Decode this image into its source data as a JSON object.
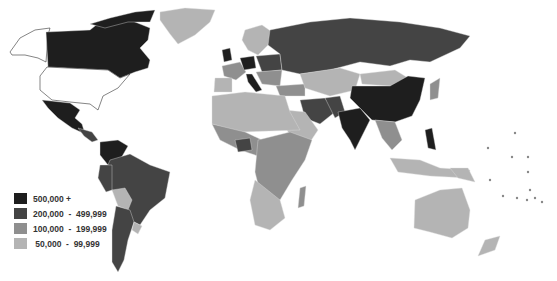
{
  "map": {
    "type": "choropleth-world",
    "colors": {
      "tier1": "#1e1e1e",
      "tier2": "#444444",
      "tier3": "#8f8f8f",
      "tier4": "#b4b4b4",
      "nodata": "#ffffff",
      "border": "#3a3a3a"
    }
  },
  "legend": {
    "items": [
      {
        "label": "500,000 +",
        "color": "#1e1e1e"
      },
      {
        "label": "200,000  -  499,999",
        "color": "#444444"
      },
      {
        "label": "100,000  -  199,999",
        "color": "#8f8f8f"
      },
      {
        "label": " 50,000  -  99,999",
        "color": "#b4b4b4"
      }
    ]
  }
}
